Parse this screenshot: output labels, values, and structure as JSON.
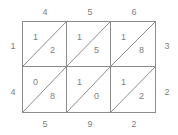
{
  "figure": {
    "type": "lattice-multiplication-grid",
    "rows": 2,
    "columns": 3,
    "line_color": "#8c8c8c",
    "text_color": "#808080",
    "background_color": "#ffffff"
  },
  "top_labels": [
    "4",
    "5",
    "6"
  ],
  "bottom_labels": [
    "5",
    "9",
    "2"
  ],
  "left_labels": [
    "1",
    "4"
  ],
  "right_labels": [
    "3",
    "2"
  ],
  "cells": [
    [
      {
        "tens": "1",
        "ones": "2"
      },
      {
        "tens": "1",
        "ones": "5"
      },
      {
        "tens": "1",
        "ones": "8"
      }
    ],
    [
      {
        "tens": "0",
        "ones": "8"
      },
      {
        "tens": "1",
        "ones": "0"
      },
      {
        "tens": "1",
        "ones": "2"
      }
    ]
  ]
}
